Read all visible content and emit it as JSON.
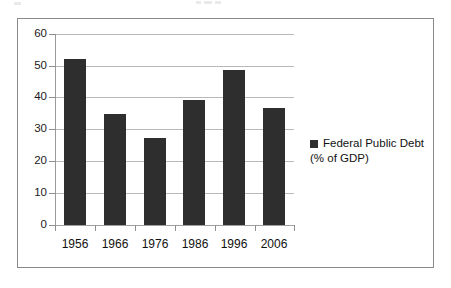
{
  "chart_data": {
    "type": "bar",
    "title": "",
    "subtitle": "",
    "xlabel": "",
    "ylabel": "",
    "categories": [
      "1956",
      "1966",
      "1976",
      "1986",
      "1996",
      "2006"
    ],
    "values": [
      52.0,
      35.0,
      27.3,
      39.3,
      48.6,
      36.9
    ],
    "series": [
      {
        "name": "Federal Public Debt (% of GDP)",
        "values": [
          52.0,
          35.0,
          27.3,
          39.3,
          48.6,
          36.9
        ]
      }
    ],
    "ylim": [
      0,
      60
    ],
    "ytick_labels": [
      "0",
      "10",
      "20",
      "30",
      "40",
      "50",
      "60"
    ],
    "ytick_values": [
      0,
      10,
      20,
      30,
      40,
      50,
      60
    ],
    "grid": true,
    "grid_axis": "y",
    "legend_position": "right",
    "legend_entries": [
      {
        "line_1": "Federal Public Debt",
        "line_2": "(% of GDP)",
        "marker": "square",
        "color": "#2e2e2e"
      }
    ],
    "bar_color": "#2e2e2e",
    "gridline_color": "#b9b9b9",
    "axis_color": "#8f8f8f",
    "frame_color": "#8a8a8a",
    "background": "#ffffff"
  }
}
